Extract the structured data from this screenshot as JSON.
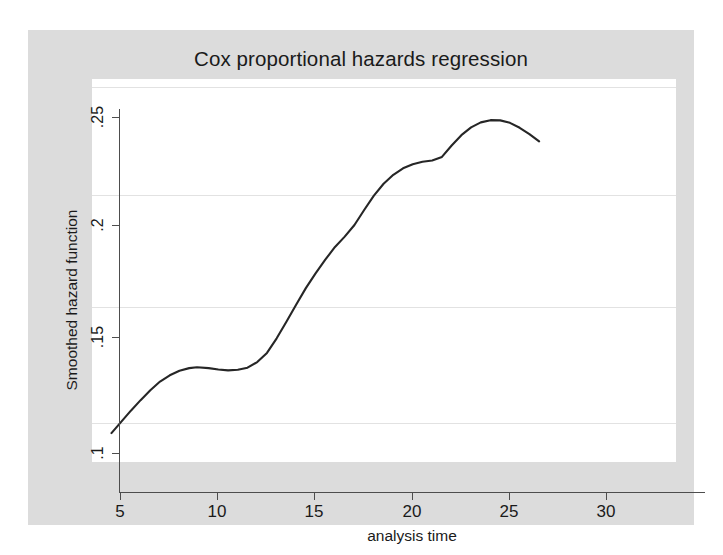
{
  "chart_data": {
    "type": "line",
    "title": "Cox proportional hazards regression",
    "xlabel": "analysis time",
    "ylabel": "Smoothed hazard function",
    "xlim": [
      5,
      30
    ],
    "ylim": [
      0.0925,
      0.2535
    ],
    "xticks": [
      5,
      10,
      15,
      20,
      25,
      30
    ],
    "yticks": [
      0.1,
      0.15,
      0.2,
      0.25
    ],
    "xtick_labels": [
      "5",
      "10",
      "15",
      "20",
      "25",
      "30"
    ],
    "ytick_labels": [
      ".1",
      ".15",
      ".2",
      ".25"
    ],
    "grid": "horizontal",
    "legend": "none",
    "line_color": "#262626",
    "background_color": "#dcdcdc",
    "plot_background_color": "#ffffff",
    "gridline_color": "#e2e2e2",
    "axis_color": "#4d4d4d",
    "series": [
      {
        "name": "Smoothed hazard function",
        "x": [
          6.0,
          6.5,
          7.0,
          7.5,
          8.0,
          8.5,
          9.0,
          9.5,
          10.0,
          10.4,
          11.0,
          11.5,
          12.0,
          12.5,
          13.0,
          13.5,
          14.0,
          14.5,
          15.0,
          15.5,
          16.0,
          16.5,
          17.0,
          17.5,
          18.0,
          18.5,
          19.0,
          19.5,
          20.0,
          20.5,
          21.0,
          21.5,
          22.0,
          22.5,
          23.0,
          23.5,
          24.0,
          24.5,
          25.0,
          25.5,
          26.0,
          26.5,
          27.0,
          27.5,
          28.0
        ],
        "y": [
          0.0955,
          0.1005,
          0.1055,
          0.1102,
          0.1146,
          0.1185,
          0.1213,
          0.1233,
          0.1245,
          0.1249,
          0.1245,
          0.1239,
          0.1235,
          0.1238,
          0.1247,
          0.1272,
          0.1313,
          0.1378,
          0.1452,
          0.1528,
          0.1602,
          0.1668,
          0.1729,
          0.1786,
          0.1832,
          0.1884,
          0.1951,
          0.2015,
          0.2068,
          0.2108,
          0.2137,
          0.2155,
          0.2166,
          0.2172,
          0.2188,
          0.2239,
          0.2285,
          0.232,
          0.2342,
          0.2352,
          0.2351,
          0.234,
          0.2318,
          0.229,
          0.2257
        ]
      }
    ]
  },
  "chart": {
    "title": "Cox proportional hazards regression",
    "x_axis_title": "analysis time",
    "y_axis_title": "Smoothed hazard function",
    "x_tick_labels": [
      "5",
      "10",
      "15",
      "20",
      "25",
      "30"
    ],
    "y_tick_labels": [
      ".25",
      ".2",
      ".15",
      ".1"
    ]
  }
}
